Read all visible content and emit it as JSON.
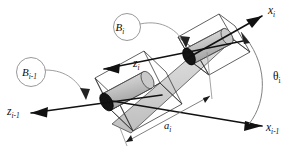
{
  "figure": {
    "name": "denavit-hartenberg-link-diagram",
    "caption": "",
    "background_color": "#ffffff",
    "width": 305,
    "height": 157
  },
  "colors": {
    "axis": "#111111",
    "leader": "#8d8d8d",
    "box_edge": "#3a3a3a",
    "cylinder_dark_cap": "#141414",
    "cylinder_light": "#c9c9c9",
    "slab_fill": "#d6d6d6",
    "dimension": "#6a6a6a",
    "arc": "#7a7a7a",
    "label_text": "#0d0d0d"
  },
  "labels": {
    "axis_x_i": {
      "base": "x",
      "sub": "i",
      "full": "x_i"
    },
    "axis_x_i_minus_1": {
      "base": "x",
      "sub": "i-1",
      "full": "x_{i-1}"
    },
    "axis_z_i": {
      "base": "z",
      "sub": "i",
      "full": "z_i"
    },
    "axis_z_i_minus_1": {
      "base": "z",
      "sub": "i-1",
      "full": "z_{i-1}"
    },
    "body_b_i": {
      "base": "B",
      "sub": "i",
      "full": "B_i"
    },
    "body_b_i_minus_1": {
      "base": "B",
      "sub": "i-1",
      "full": "B_{i-1}"
    },
    "angle_theta_i": {
      "base": "θ",
      "sub": "i",
      "full": "theta_i"
    },
    "length_a_i": {
      "base": "a",
      "sub": "i",
      "full": "a_i"
    }
  },
  "elements": {
    "upper_joint_cylinder": "cylinder-joint-i",
    "lower_joint_cylinder": "cylinder-joint-i-minus-1",
    "upper_box": "box-joint-i",
    "lower_box": "box-joint-i-minus-1",
    "link_slab": "link-body-slab",
    "theta_arc": "theta-angle-arc",
    "a_dimension": "link-length-dimension"
  }
}
